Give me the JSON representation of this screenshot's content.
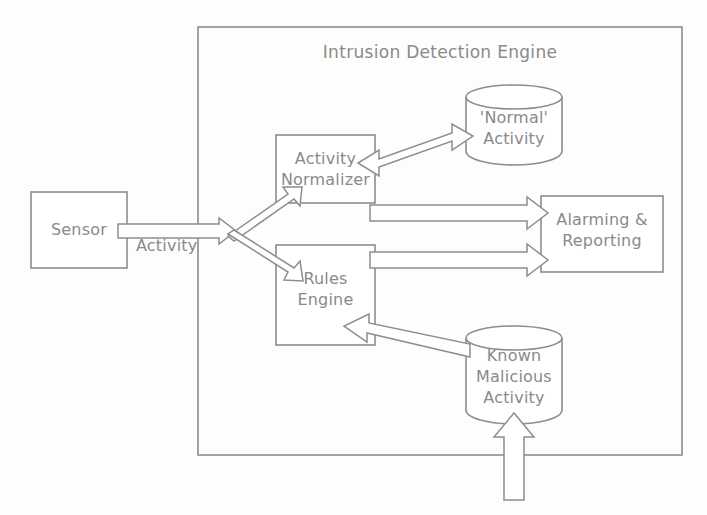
{
  "diagram": {
    "title": "Intrusion Detection Engine",
    "line_color": "#8d8d8d",
    "text_color": "#8a8a8a",
    "background_color": "#fdfdfd",
    "boundary": {
      "name": "Intrusion Detection Engine",
      "label": "Intrusion Detection Engine",
      "shape": "rectangle",
      "x": 198,
      "y": 27,
      "width": 484,
      "height": 428
    },
    "nodes": [
      {
        "id": "sensor",
        "label": "Sensor",
        "shape": "rectangle",
        "x": 31,
        "y": 192,
        "width": 96,
        "height": 76,
        "inside_engine": false
      },
      {
        "id": "activity-normalizer",
        "label": "Activity\nNormalizer",
        "shape": "rectangle",
        "x": 276,
        "y": 135,
        "width": 99,
        "height": 68,
        "inside_engine": true
      },
      {
        "id": "rules-engine",
        "label": "Rules\nEngine",
        "shape": "rectangle",
        "x": 276,
        "y": 245,
        "width": 99,
        "height": 100,
        "inside_engine": true
      },
      {
        "id": "alarming-reporting",
        "label": "Alarming &\nReporting",
        "shape": "rectangle",
        "x": 541,
        "y": 196,
        "width": 122,
        "height": 76,
        "inside_engine": true
      },
      {
        "id": "normal-activity-store",
        "label": "'Normal'\nActivity",
        "shape": "cylinder",
        "x": 466,
        "y": 85,
        "width": 96,
        "height": 78,
        "inside_engine": true
      },
      {
        "id": "known-malicious-activity-store",
        "label": "Known\nMalicious\nActivity",
        "shape": "cylinder",
        "x": 466,
        "y": 326,
        "width": 96,
        "height": 98,
        "inside_engine": true
      }
    ],
    "edges": [
      {
        "id": "sensor-activity",
        "label": "Activity",
        "from": "sensor",
        "to": "split-junction",
        "style": "block-arrow",
        "direction": "right"
      },
      {
        "id": "split-to-normalizer",
        "label": "",
        "from": "split-junction",
        "to": "activity-normalizer",
        "style": "block-arrow",
        "direction": "up-right"
      },
      {
        "id": "split-to-rules-engine",
        "label": "",
        "from": "split-junction",
        "to": "rules-engine",
        "style": "block-arrow",
        "direction": "down-right"
      },
      {
        "id": "normalizer-normal-activity",
        "label": "",
        "from": "activity-normalizer",
        "to": "normal-activity-store",
        "style": "block-arrow",
        "direction": "bidirectional"
      },
      {
        "id": "normalizer-alarming",
        "label": "",
        "from": "activity-normalizer",
        "to": "alarming-reporting",
        "style": "block-arrow",
        "direction": "right"
      },
      {
        "id": "rules-alarming",
        "label": "",
        "from": "rules-engine",
        "to": "alarming-reporting",
        "style": "block-arrow",
        "direction": "right"
      },
      {
        "id": "malicious-to-rules",
        "label": "",
        "from": "known-malicious-activity-store",
        "to": "rules-engine",
        "style": "block-arrow",
        "direction": "left"
      },
      {
        "id": "external-feed-to-malicious",
        "label": "",
        "from": "external",
        "to": "known-malicious-activity-store",
        "style": "block-arrow",
        "direction": "up"
      }
    ]
  }
}
